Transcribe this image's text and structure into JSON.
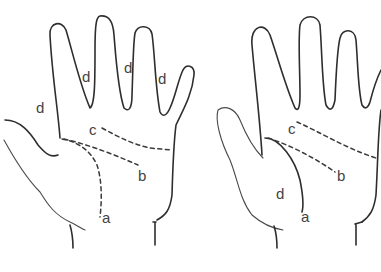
{
  "figure": {
    "panels": [
      {
        "id": "left-hand",
        "labels": {
          "a": "a",
          "b": "b",
          "c": "c",
          "d_thumb_side": "d",
          "d_finger_1": "d",
          "d_finger_2": "d",
          "d_finger_3": "d"
        }
      },
      {
        "id": "right-hand",
        "labels": {
          "a": "a",
          "b": "b",
          "c": "c",
          "d_thenar": "d"
        }
      }
    ],
    "colors": {
      "line": "#2e2e2e",
      "label": "#444444",
      "background": "#ffffff"
    }
  }
}
